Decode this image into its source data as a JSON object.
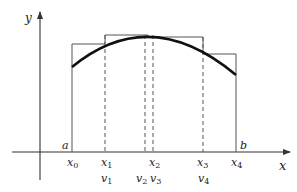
{
  "diagram": {
    "axes": {
      "x_label": "x",
      "y_label": "y"
    },
    "interval": {
      "a_label": "a",
      "b_label": "b"
    },
    "partition_points": [
      {
        "name": "x",
        "sub": "0"
      },
      {
        "name": "x",
        "sub": "1"
      },
      {
        "name": "x",
        "sub": "2"
      },
      {
        "name": "x",
        "sub": "3"
      },
      {
        "name": "x",
        "sub": "4"
      }
    ],
    "sample_points": [
      {
        "name": "v",
        "sub": "1"
      },
      {
        "name": "v",
        "sub": "2"
      },
      {
        "name": "v",
        "sub": "3"
      },
      {
        "name": "v",
        "sub": "4"
      }
    ],
    "colors": {
      "curve": "#111111",
      "rectangles": "#555555",
      "axes": "#333333"
    }
  }
}
